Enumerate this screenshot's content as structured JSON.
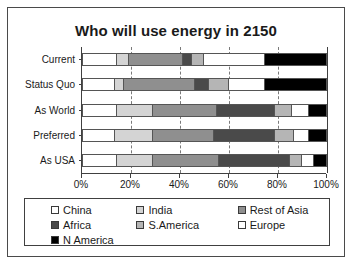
{
  "chart_data": {
    "type": "bar",
    "orientation": "horizontal",
    "stacked": true,
    "normalized_percent": true,
    "title": "Who will use energy in 2150",
    "xlabel": "",
    "ylabel": "",
    "xlim": [
      0,
      100
    ],
    "xticks": [
      "0%",
      "20%",
      "40%",
      "60%",
      "80%",
      "100%"
    ],
    "xtick_values": [
      0,
      20,
      40,
      60,
      80,
      100
    ],
    "grid": "vertical-dashed",
    "legend_position": "bottom",
    "categories": [
      "Current",
      "Status Quo",
      "As World",
      "Preferred",
      "As USA"
    ],
    "series": [
      {
        "name": "China",
        "color": "#ffffff",
        "values": [
          14,
          13,
          14,
          13,
          14
        ]
      },
      {
        "name": "India",
        "color": "#d4d4d4",
        "values": [
          5,
          4,
          15,
          16,
          15
        ]
      },
      {
        "name": "Rest of Asia",
        "color": "#8f8f8f",
        "values": [
          22,
          29,
          26,
          25,
          27
        ]
      },
      {
        "name": "Africa",
        "color": "#4a4a4a",
        "values": [
          4,
          6,
          24,
          25,
          29
        ]
      },
      {
        "name": "S.America",
        "color": "#b5b5b5",
        "values": [
          5,
          8,
          7,
          8,
          5
        ]
      },
      {
        "name": "Europe",
        "color": "#ffffff",
        "values": [
          25,
          15,
          7,
          6,
          5
        ]
      },
      {
        "name": "N America",
        "color": "#000000",
        "values": [
          25,
          25,
          7,
          7,
          5
        ]
      }
    ]
  },
  "legend": {
    "entries": [
      {
        "label": "China",
        "swatch": "#ffffff"
      },
      {
        "label": "India",
        "swatch": "#d4d4d4"
      },
      {
        "label": "Rest of Asia",
        "swatch": "#8f8f8f"
      },
      {
        "label": "Africa",
        "swatch": "#4a4a4a"
      },
      {
        "label": "S.America",
        "swatch": "#b5b5b5"
      },
      {
        "label": "Europe",
        "swatch": "#ffffff"
      },
      {
        "label": "N America",
        "swatch": "#000000"
      }
    ]
  }
}
